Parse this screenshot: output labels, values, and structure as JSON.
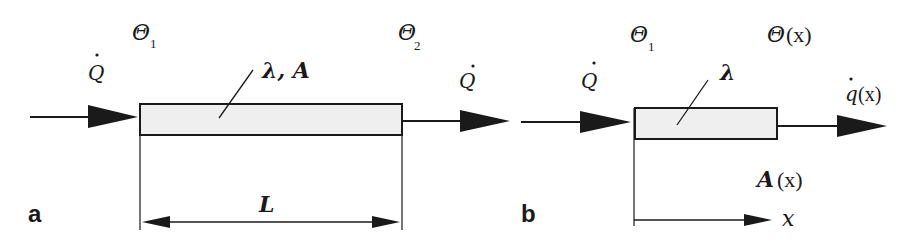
{
  "figure": {
    "panel_a": {
      "label": "a",
      "heat_flow_in": "Q",
      "heat_flow_out": "Q",
      "temp_left": {
        "symbol": "Θ",
        "subscript": "1"
      },
      "temp_right": {
        "symbol": "Θ",
        "subscript": "2"
      },
      "material_label": "λ, A",
      "length_label": "L"
    },
    "panel_b": {
      "label": "b",
      "heat_flow_in": "Q",
      "temp_left": {
        "symbol": "Θ",
        "subscript": "1"
      },
      "temp_x": {
        "symbol": "Θ",
        "arg": "(x)"
      },
      "heat_flux_out": {
        "symbol": "q",
        "arg": "(x)"
      },
      "material_label": "λ",
      "area_label": {
        "symbol": "A",
        "arg": "(x)"
      },
      "axis_label": "x"
    },
    "colors": {
      "stroke": "#1a1a1a",
      "bar_fill": "#efefef",
      "background": "#ffffff"
    }
  }
}
